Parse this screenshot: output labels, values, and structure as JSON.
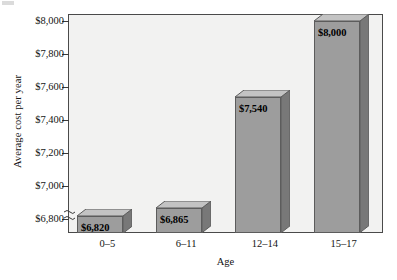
{
  "chart_data": {
    "type": "bar",
    "title": "",
    "subtitle": "",
    "xlabel": "Age",
    "ylabel": "Average cost per year",
    "categories": [
      "0–5",
      "6–11",
      "12–14",
      "15–17"
    ],
    "values": [
      6820,
      6865,
      7540,
      8000
    ],
    "data_labels": [
      "$6,820",
      "$6,865",
      "$7,540",
      "$8,000"
    ],
    "ytick_labels": [
      "$8,000",
      "$7,800",
      "$7,600",
      "$7,400",
      "$7,200",
      "$7,000",
      "$6,800"
    ],
    "ytick_values": [
      8000,
      7800,
      7600,
      7400,
      7200,
      7000,
      6800
    ],
    "ylim": [
      6715,
      8045
    ],
    "y_axis_break": true,
    "y_axis_break_symbol": "≈",
    "grid": false,
    "legend": null,
    "legend_position": "none",
    "style": "3d-bar",
    "colors": {
      "bar_front": "#9d9d9d",
      "bar_top": "#c3c3c3",
      "bar_side": "#787878",
      "bar_outline": "#5c5c5c",
      "plot_background": "#f2f2f1",
      "frame": "#4a4a4a",
      "text": "#141414",
      "page_background": "#ffffff"
    }
  },
  "axis": {
    "y_title": "Average cost per year",
    "x_title": "Age"
  },
  "icons": {
    "axis_break": "axis-break-icon"
  }
}
